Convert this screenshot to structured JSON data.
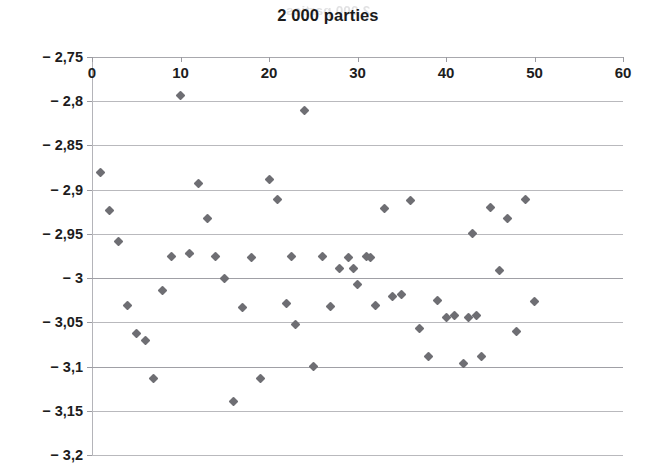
{
  "figure": {
    "width": 656,
    "height": 471,
    "background": "#ffffff",
    "bleed_through_text": "2 000 parties",
    "marker_color": "#6e6e73",
    "gridline_color": "#b9b9bd",
    "text_color": "#1d1d1d"
  },
  "chart_data": {
    "type": "scatter",
    "title": "2 000 parties",
    "subtitle": "",
    "xlabel": "",
    "ylabel": "",
    "xlim": [
      0,
      60
    ],
    "ylim": [
      -3.2,
      -2.75
    ],
    "y_axis_inverted": true,
    "x_axis_position": "top",
    "y_axis_position": "left",
    "grid": "horizontal",
    "legend": "none",
    "xticks": [
      0,
      10,
      20,
      30,
      40,
      50,
      60
    ],
    "xtick_labels": [
      "0",
      "10",
      "20",
      "30",
      "40",
      "50",
      "60"
    ],
    "yticks": [
      -2.75,
      -2.8,
      -2.85,
      -2.9,
      -2.95,
      -3.0,
      -3.05,
      -3.1,
      -3.15,
      -3.2
    ],
    "ytick_labels": [
      "− 2,75",
      "− 2,8",
      "− 2,85",
      "− 2,9",
      "− 2,95",
      "− 3",
      "− 3,05",
      "− 3,1",
      "− 3,15",
      "− 3,2"
    ],
    "decimal_separator": ",",
    "marker": "diamond",
    "n_points": 55,
    "x": [
      1,
      2,
      3,
      4,
      5,
      6,
      7,
      8,
      9,
      10,
      11,
      12,
      13,
      14,
      15,
      16,
      17,
      18,
      19,
      20,
      21,
      22,
      23,
      24,
      25,
      26,
      27,
      28,
      29,
      30,
      31,
      32,
      33,
      34,
      35,
      36,
      37,
      38,
      39,
      40,
      41,
      42,
      43,
      44,
      45,
      46,
      47,
      48,
      49,
      50,
      22.5,
      29.5,
      31.5,
      42.5,
      43.5
    ],
    "y": [
      -2.881,
      -2.923,
      -2.959,
      -3.031,
      -3.063,
      -3.07,
      -3.114,
      -3.014,
      -2.976,
      -2.793,
      -2.972,
      -2.893,
      -2.933,
      -2.975,
      -3.0,
      -3.14,
      -3.033,
      -2.977,
      -3.114,
      -2.889,
      -2.911,
      -3.029,
      -3.053,
      -2.811,
      -3.1,
      -2.976,
      -3.032,
      -2.989,
      -2.977,
      -3.007,
      -2.976,
      -3.031,
      -2.921,
      -3.021,
      -3.019,
      -2.912,
      -3.057,
      -3.089,
      -3.025,
      -3.044,
      -3.042,
      -3.097,
      -2.95,
      -3.089,
      -2.92,
      -2.991,
      -2.933,
      -3.06,
      -2.911,
      -3.026,
      -2.976,
      -2.989,
      -2.977,
      -3.044,
      -3.042
    ]
  }
}
